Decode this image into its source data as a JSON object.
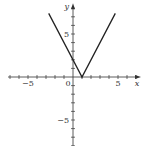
{
  "chart_data": {
    "type": "line",
    "title": "",
    "function": "y = 2|x - 1|",
    "xlabel": "x",
    "ylabel": "y",
    "xlim": [
      -7,
      7
    ],
    "ylim": [
      -8,
      8
    ],
    "grid": false,
    "x_tick_labels": [
      {
        "value": -5,
        "label": "−5"
      },
      {
        "value": 0,
        "label": "0"
      },
      {
        "value": 5,
        "label": "5"
      }
    ],
    "y_tick_labels": [
      {
        "value": 5,
        "label": "5"
      },
      {
        "value": -5,
        "label": "−5"
      }
    ],
    "series": [
      {
        "name": "V-graph",
        "x": [
          -2.7,
          1,
          4.7
        ],
        "y": [
          7.4,
          0,
          7.4
        ],
        "color": "#222222"
      }
    ]
  },
  "layout": {
    "origin_px": [
      73,
      77
    ],
    "x_unit_px": 9.0,
    "y_unit_px": 8.6
  }
}
